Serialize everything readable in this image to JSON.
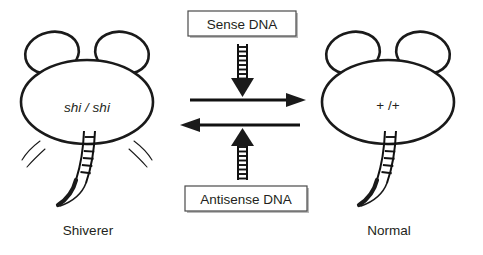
{
  "figure": {
    "background_color": "#ffffff",
    "ink_color": "#1a1a1a"
  },
  "left_subject": {
    "name": "shiverer-mouse",
    "genotype": "shi / shi",
    "caption": "Shiverer",
    "has_motion_lines": true,
    "motion_line_count": 4
  },
  "right_subject": {
    "name": "normal-mouse",
    "genotype": "+ /+",
    "caption": "Normal",
    "has_motion_lines": false,
    "motion_line_count": 0
  },
  "top_box": {
    "label": "Sense DNA",
    "arrow_direction": "down",
    "arrow_style": "ladder"
  },
  "bottom_box": {
    "label": "Antisense DNA",
    "arrow_direction": "up",
    "arrow_style": "ladder"
  },
  "horizontal_arrows": [
    {
      "name": "forward-arrow",
      "direction": "right"
    },
    {
      "name": "reverse-arrow",
      "direction": "left"
    }
  ]
}
